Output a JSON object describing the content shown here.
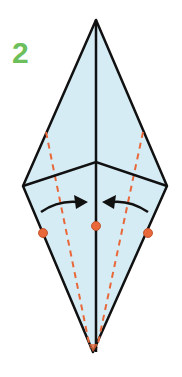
{
  "diagram": {
    "step_number": "2",
    "colors": {
      "paper_fill": "#d6ecf5",
      "outline": "#111111",
      "fold_line": "#e8683a",
      "marker": "#e8683a",
      "step_label": "#6cbf5a"
    }
  }
}
